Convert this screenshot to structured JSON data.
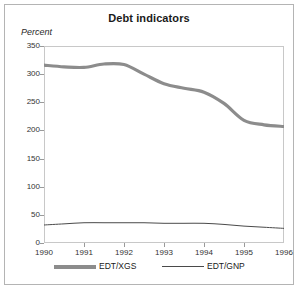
{
  "figure": {
    "title": "Debt indicators",
    "ylabel": "Percent"
  },
  "legend": {
    "items": [
      {
        "label": "EDT/XGS",
        "style": "thick",
        "color": "#8c8c8c"
      },
      {
        "label": "EDT/GNP",
        "style": "thin",
        "color": "#4a4a4a"
      }
    ]
  },
  "colors": {
    "edt_xgs": "#8c8c8c",
    "edt_gnp": "#4a4a4a",
    "frame": "#c8c8c8",
    "outer_frame": "#b4b4b4",
    "tick": "#9a9a9a"
  },
  "chart_data": {
    "type": "line",
    "title": "Debt indicators",
    "xlabel": "",
    "ylabel": "Percent",
    "xlim": [
      1990,
      1996
    ],
    "ylim": [
      0,
      350
    ],
    "yticks": [
      0,
      50,
      100,
      150,
      200,
      250,
      300,
      350
    ],
    "xticks": [
      1990,
      1991,
      1992,
      1993,
      1994,
      1995,
      1996
    ],
    "grid": false,
    "legend_position": "bottom",
    "x": [
      1990,
      1990.5,
      1991,
      1991.5,
      1992,
      1992.5,
      1993,
      1993.5,
      1994,
      1994.5,
      1995,
      1995.5,
      1996
    ],
    "series": [
      {
        "name": "EDT/XGS",
        "color": "#8c8c8c",
        "width": 3.2,
        "values": [
          316,
          313,
          312,
          318,
          317,
          300,
          283,
          275,
          268,
          248,
          218,
          210,
          207
        ]
      },
      {
        "name": "EDT/GNP",
        "color": "#4a4a4a",
        "width": 1,
        "values": [
          32,
          34,
          36,
          36,
          36,
          36,
          35,
          35,
          35,
          33,
          30,
          28,
          26
        ]
      }
    ]
  }
}
